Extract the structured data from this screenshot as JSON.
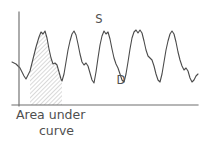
{
  "figure": {
    "caption_line_1": "Area under",
    "caption_line_2": "curve",
    "systolic_label": "S",
    "diastolic_label": "D",
    "stroke_color": "#4a4a4a",
    "axis_color": "#6e6e6e",
    "hatch_color": "#9a9a9a",
    "text_color": "#4f4f4f",
    "background_color": "#ffffff"
  },
  "chart_data": {
    "type": "line",
    "title": "Area under curve",
    "xlabel": "",
    "ylabel": "",
    "grid": false,
    "legend": null,
    "axis": {
      "y_axis_x": 19,
      "y_axis_top": 12,
      "y_axis_bottom": 106,
      "x_axis_y": 105,
      "x_axis_left": 12,
      "x_axis_right": 198
    },
    "annotations": [
      {
        "text": "S",
        "x": 99,
        "y": 23,
        "meaning": "systolic-peak"
      },
      {
        "text": "D",
        "x": 121,
        "y": 84,
        "meaning": "diastolic-trough"
      },
      {
        "text": "Area under curve",
        "x": 16,
        "y": 120,
        "meaning": "shaded-region-caption"
      }
    ],
    "shaded_region": {
      "label": "Area under curve",
      "x_start": 30,
      "x_end": 62,
      "baseline_y": 105,
      "fill": "hatched"
    },
    "series": [
      {
        "name": "arterial pressure",
        "points": [
          [
            12,
            62
          ],
          [
            16,
            64
          ],
          [
            20,
            68
          ],
          [
            24,
            76
          ],
          [
            26,
            79
          ],
          [
            30,
            71
          ],
          [
            33,
            59
          ],
          [
            36,
            47
          ],
          [
            39,
            37
          ],
          [
            41,
            32
          ],
          [
            43,
            34
          ],
          [
            45,
            31
          ],
          [
            47,
            38
          ],
          [
            49,
            49
          ],
          [
            51,
            58
          ],
          [
            53,
            64
          ],
          [
            55,
            63
          ],
          [
            57,
            65
          ],
          [
            59,
            72
          ],
          [
            61,
            79
          ],
          [
            62,
            81
          ],
          [
            64,
            74
          ],
          [
            66,
            62
          ],
          [
            68,
            50
          ],
          [
            70,
            41
          ],
          [
            72,
            34
          ],
          [
            74,
            31
          ],
          [
            76,
            35
          ],
          [
            78,
            44
          ],
          [
            80,
            54
          ],
          [
            82,
            62
          ],
          [
            84,
            65
          ],
          [
            86,
            63
          ],
          [
            88,
            66
          ],
          [
            90,
            73
          ],
          [
            92,
            80
          ],
          [
            94,
            83
          ],
          [
            96,
            72
          ],
          [
            98,
            58
          ],
          [
            100,
            45
          ],
          [
            102,
            36
          ],
          [
            104,
            31
          ],
          [
            106,
            34
          ],
          [
            108,
            32
          ],
          [
            110,
            39
          ],
          [
            112,
            49
          ],
          [
            114,
            58
          ],
          [
            116,
            64
          ],
          [
            118,
            68
          ],
          [
            120,
            74
          ],
          [
            122,
            80
          ],
          [
            124,
            82
          ],
          [
            126,
            74
          ],
          [
            128,
            62
          ],
          [
            130,
            49
          ],
          [
            132,
            38
          ],
          [
            134,
            32
          ],
          [
            136,
            30
          ],
          [
            138,
            33
          ],
          [
            140,
            30
          ],
          [
            142,
            33
          ],
          [
            144,
            41
          ],
          [
            146,
            50
          ],
          [
            148,
            56
          ],
          [
            150,
            58
          ],
          [
            152,
            60
          ],
          [
            154,
            66
          ],
          [
            156,
            74
          ],
          [
            158,
            80
          ],
          [
            160,
            82
          ],
          [
            162,
            74
          ],
          [
            164,
            62
          ],
          [
            166,
            50
          ],
          [
            168,
            41
          ],
          [
            170,
            34
          ],
          [
            172,
            31
          ],
          [
            174,
            34
          ],
          [
            176,
            42
          ],
          [
            178,
            52
          ],
          [
            180,
            60
          ],
          [
            182,
            66
          ],
          [
            184,
            70
          ],
          [
            186,
            68
          ],
          [
            188,
            71
          ],
          [
            190,
            78
          ],
          [
            192,
            82
          ],
          [
            194,
            80
          ],
          [
            196,
            76
          ],
          [
            198,
            74
          ]
        ]
      }
    ]
  }
}
